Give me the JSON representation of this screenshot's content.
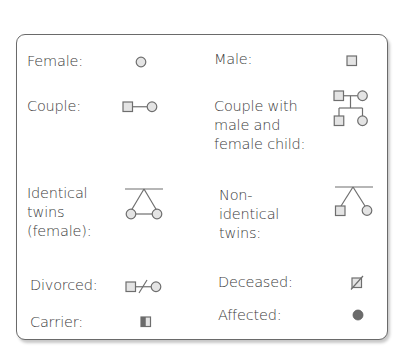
{
  "legend": {
    "colors": {
      "border": "#6a6a6a",
      "symbol_stroke": "#6e6e6e",
      "symbol_fill": "#e4e4e4",
      "affected_fill": "#6b6b6b",
      "text": "#3a3a3a"
    },
    "items": [
      {
        "key": "female",
        "label": "Female:",
        "symbol": "circle-icon"
      },
      {
        "key": "male",
        "label": "Male:",
        "symbol": "square-icon"
      },
      {
        "key": "couple",
        "label": "Couple:",
        "symbol": "couple-icon"
      },
      {
        "key": "couple_children",
        "label": "Couple with\nmale and\nfemale child:",
        "symbol": "family-tree-icon"
      },
      {
        "key": "identical_twins",
        "label": "Identical\ntwins\n(female):",
        "symbol": "identical-twins-icon"
      },
      {
        "key": "non_identical_twins",
        "label": "Non-\nidentical\ntwins:",
        "symbol": "non-identical-twins-icon"
      },
      {
        "key": "divorced",
        "label": "Divorced:",
        "symbol": "divorced-couple-icon"
      },
      {
        "key": "deceased",
        "label": "Deceased:",
        "symbol": "deceased-icon"
      },
      {
        "key": "carrier",
        "label": "Carrier:",
        "symbol": "carrier-icon"
      },
      {
        "key": "affected",
        "label": "Affected:",
        "symbol": "affected-icon"
      }
    ]
  }
}
